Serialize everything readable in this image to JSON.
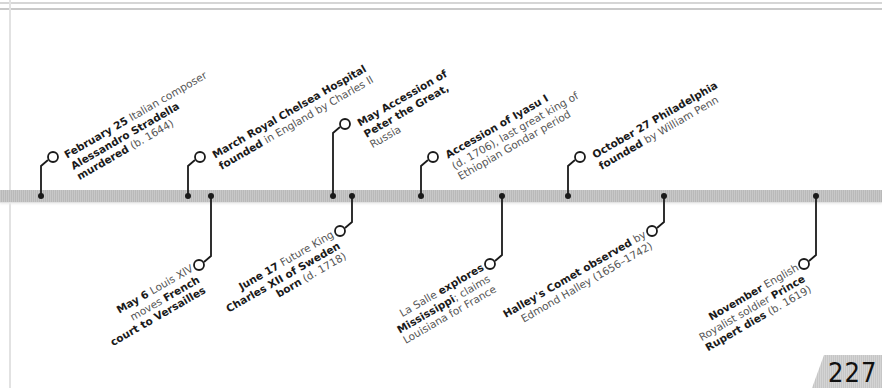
{
  "page": {
    "number": "227"
  },
  "events_above": [
    {
      "id": "feb25",
      "parts": [
        {
          "t": "February 25",
          "b": true
        },
        {
          "t": " Italian composer",
          "b": false
        },
        {
          "br": true
        },
        {
          "t": "Alessandro Stradella",
          "b": true
        },
        {
          "br": true
        },
        {
          "t": "murdered",
          "b": true
        },
        {
          "t": " (b. 1644)",
          "b": false
        }
      ]
    },
    {
      "id": "march",
      "parts": [
        {
          "t": "March",
          "b": true
        },
        {
          "t": " Royal Chelsea Hospital",
          "b": true
        },
        {
          "br": true
        },
        {
          "t": "founded",
          "b": true
        },
        {
          "t": " in England by Charles II",
          "b": false
        }
      ]
    },
    {
      "id": "may",
      "parts": [
        {
          "t": "May",
          "b": true
        },
        {
          "t": " Accession of",
          "b": true
        },
        {
          "br": true
        },
        {
          "t": "Peter the Great,",
          "b": true
        },
        {
          "br": true
        },
        {
          "t": "Russia",
          "b": false
        }
      ]
    },
    {
      "id": "iyasu",
      "parts": [
        {
          "t": "Accession of Iyasu I",
          "b": true
        },
        {
          "br": true
        },
        {
          "t": "(d. 1706), last great king of",
          "b": false
        },
        {
          "br": true
        },
        {
          "t": "Ethiopian Gondar period",
          "b": false
        }
      ]
    },
    {
      "id": "oct27",
      "parts": [
        {
          "t": "October 27",
          "b": true
        },
        {
          "t": " Philadelphia",
          "b": true
        },
        {
          "br": true
        },
        {
          "t": "founded",
          "b": true
        },
        {
          "t": " by William Penn",
          "b": false
        }
      ]
    }
  ],
  "events_below": [
    {
      "id": "may6",
      "parts": [
        {
          "t": "May 6",
          "b": true
        },
        {
          "t": " Louis XIV",
          "b": false
        },
        {
          "br": true
        },
        {
          "t": "moves ",
          "b": false
        },
        {
          "t": "French",
          "b": true
        },
        {
          "br": true
        },
        {
          "t": "court to Versailles",
          "b": true
        }
      ]
    },
    {
      "id": "june17",
      "parts": [
        {
          "t": "June 17",
          "b": true
        },
        {
          "t": " Future King",
          "b": false
        },
        {
          "br": true
        },
        {
          "t": "Charles XII of Sweden",
          "b": true
        },
        {
          "br": true
        },
        {
          "t": "born",
          "b": true
        },
        {
          "t": " (d. 1718)",
          "b": false
        }
      ]
    },
    {
      "id": "lasalle",
      "parts": [
        {
          "t": "La Salle ",
          "b": false
        },
        {
          "t": "explores",
          "b": true
        },
        {
          "br": true
        },
        {
          "t": "Mississippi",
          "b": true
        },
        {
          "t": "; claims",
          "b": false
        },
        {
          "br": true
        },
        {
          "t": "Louisiana for France",
          "b": false
        }
      ]
    },
    {
      "id": "halley",
      "parts": [
        {
          "t": "Halley's Comet observed",
          "b": true
        },
        {
          "t": " by",
          "b": false
        },
        {
          "br": true
        },
        {
          "t": "Edmond Halley (1656–1742)",
          "b": false
        }
      ]
    },
    {
      "id": "november",
      "parts": [
        {
          "t": "November",
          "b": true
        },
        {
          "t": " English",
          "b": false
        },
        {
          "br": true
        },
        {
          "t": "Royalist soldier ",
          "b": false
        },
        {
          "t": "Prince",
          "b": true
        },
        {
          "br": true
        },
        {
          "t": "Rupert dies",
          "b": true
        },
        {
          "t": " (b. 1619)",
          "b": false
        }
      ]
    }
  ]
}
